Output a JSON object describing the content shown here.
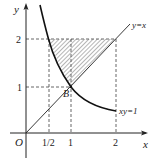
{
  "figure": {
    "type": "coordinate-plane",
    "axes": {
      "x_label": "x",
      "y_label": "y",
      "origin_label": "O"
    },
    "ticks": {
      "x": [
        {
          "value": 0.5,
          "label": "1/2"
        },
        {
          "value": 1,
          "label": "1"
        },
        {
          "value": 2,
          "label": "2"
        }
      ],
      "y": [
        {
          "value": 1,
          "label": "1"
        },
        {
          "value": 2,
          "label": "2"
        }
      ]
    },
    "curves": [
      {
        "name": "line",
        "equation": "y=x",
        "label": "y=x"
      },
      {
        "name": "hyperbola",
        "equation": "xy=1",
        "label": "xy=1"
      }
    ],
    "points": [
      {
        "name": "B",
        "label": "B",
        "x": 1,
        "y": 1
      }
    ],
    "shaded_region": {
      "description": "region bounded by y=2, y=x and xy=1",
      "vertices": [
        [
          0.5,
          2
        ],
        [
          2,
          2
        ],
        [
          1,
          1
        ]
      ],
      "fill": "hatched"
    },
    "colors": {
      "stroke": "#222222",
      "dashed": "#555555",
      "hatch": "#777777"
    }
  }
}
